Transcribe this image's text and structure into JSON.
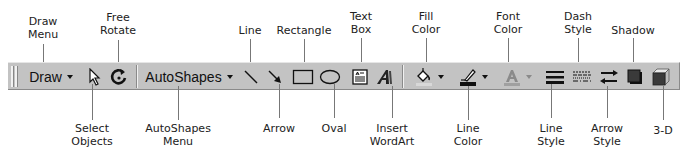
{
  "toolbar": {
    "draw_label": "Draw",
    "autoshapes_label": "AutoShapes",
    "background_color": "#c3c3c3"
  },
  "buttons": [
    {
      "id": "draw-menu",
      "icon": "dropdown-caret"
    },
    {
      "id": "select-objects",
      "icon": "pointer-arrow-icon"
    },
    {
      "id": "free-rotate",
      "icon": "rotate-icon"
    },
    {
      "id": "autoshapes-menu",
      "icon": "dropdown-caret"
    },
    {
      "id": "line",
      "icon": "line-icon"
    },
    {
      "id": "arrow",
      "icon": "arrow-icon"
    },
    {
      "id": "rectangle",
      "icon": "rectangle-icon"
    },
    {
      "id": "oval",
      "icon": "oval-icon"
    },
    {
      "id": "text-box",
      "icon": "text-box-icon"
    },
    {
      "id": "insert-wordart",
      "icon": "wordart-icon"
    },
    {
      "id": "fill-color",
      "icon": "paint-bucket-icon",
      "swatch": "#d8d8d8"
    },
    {
      "id": "line-color",
      "icon": "pen-icon",
      "swatch": "#111111"
    },
    {
      "id": "font-color",
      "icon": "font-a-icon",
      "swatch": "#a0a0a0"
    },
    {
      "id": "line-style",
      "icon": "line-style-icon"
    },
    {
      "id": "dash-style",
      "icon": "dash-style-icon"
    },
    {
      "id": "arrow-style",
      "icon": "arrow-style-icon"
    },
    {
      "id": "shadow",
      "icon": "shadow-icon"
    },
    {
      "id": "3d",
      "icon": "cube-icon"
    }
  ],
  "callouts": {
    "top": [
      {
        "text": "Draw\nMenu",
        "target": "draw-menu"
      },
      {
        "text": "Free\nRotate",
        "target": "free-rotate"
      },
      {
        "text": "Line",
        "target": "line"
      },
      {
        "text": "Rectangle",
        "target": "rectangle"
      },
      {
        "text": "Text\nBox",
        "target": "text-box"
      },
      {
        "text": "Fill\nColor",
        "target": "fill-color"
      },
      {
        "text": "Font\nColor",
        "target": "font-color"
      },
      {
        "text": "Dash\nStyle",
        "target": "dash-style"
      },
      {
        "text": "Shadow",
        "target": "shadow"
      }
    ],
    "bottom": [
      {
        "text": "Select\nObjects",
        "target": "select-objects"
      },
      {
        "text": "AutoShapes\nMenu",
        "target": "autoshapes-menu"
      },
      {
        "text": "Arrow",
        "target": "arrow"
      },
      {
        "text": "Oval",
        "target": "oval"
      },
      {
        "text": "Insert\nWordArt",
        "target": "insert-wordart"
      },
      {
        "text": "Line\nColor",
        "target": "line-color"
      },
      {
        "text": "Line\nStyle",
        "target": "line-style"
      },
      {
        "text": "Arrow\nStyle",
        "target": "arrow-style"
      },
      {
        "text": "3-D",
        "target": "3d"
      }
    ]
  }
}
